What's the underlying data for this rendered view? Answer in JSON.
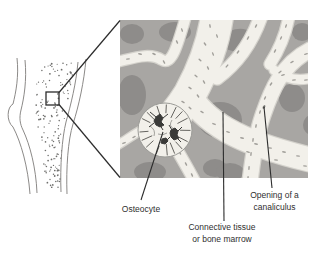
{
  "figure": {
    "type": "anatomy-diagram",
    "labels": {
      "osteocyte": "Osteocyte",
      "connective": "Connective tissue\nor bone marrow",
      "canaliculus": "Opening of a\ncanaliculus"
    }
  },
  "colors": {
    "marrow_space": "#a8a6a3",
    "marrow_shadow": "#8e8c8a",
    "trabecula": "#f2f0ea",
    "trabecula_edge": "#d4d2cc",
    "speckle": "#a09e99",
    "inset_outline": "#8c8a88",
    "pointer": "#2c2c2c",
    "label_text": "#2f2f2f"
  }
}
